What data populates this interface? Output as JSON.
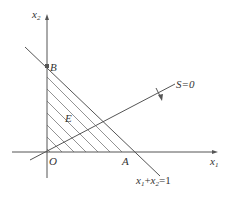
{
  "diagram": {
    "axes": {
      "x_label": "x",
      "x_sub": "1",
      "y_label": "x",
      "y_sub": "2"
    },
    "points": {
      "origin": "O",
      "a": "A",
      "b": "B"
    },
    "region_label": "E",
    "constraint_line": {
      "label_x1": "x",
      "label_sub1": "1",
      "label_plus": "+",
      "label_x2": "x",
      "label_sub2": "2",
      "label_eq": "=1"
    },
    "objective_line": {
      "label": "S=0"
    },
    "colors": {
      "line": "#555555",
      "hatch": "#777777",
      "point": "#555555"
    }
  }
}
